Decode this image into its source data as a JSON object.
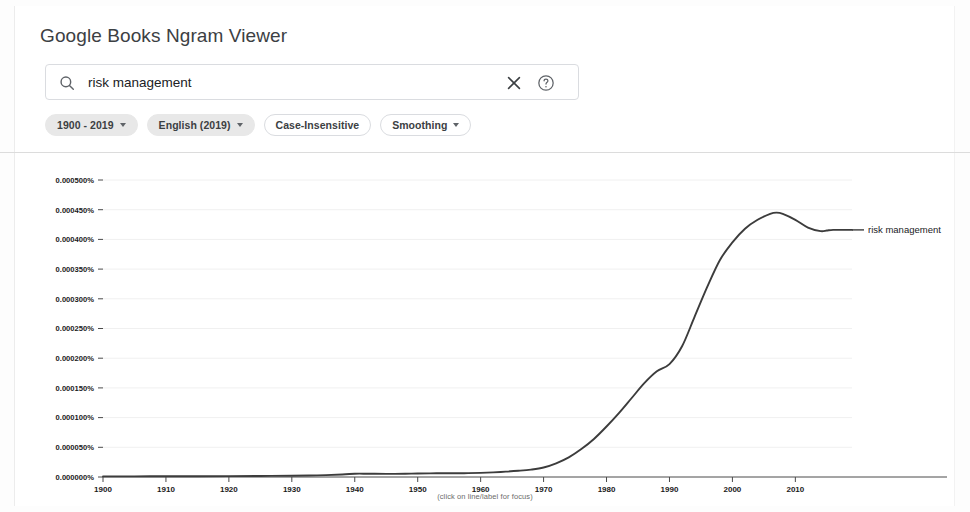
{
  "header": {
    "title": "Google Books Ngram Viewer"
  },
  "search": {
    "value": "risk management",
    "placeholder": "Search in Google Books Ngram Viewer",
    "search_icon": "search-icon",
    "clear_icon": "close-icon",
    "help_icon": "help-circle-icon"
  },
  "filters": [
    {
      "label": "1900 - 2019",
      "style": "filled",
      "has_caret": true
    },
    {
      "label": "English (2019)",
      "style": "filled",
      "has_caret": true
    },
    {
      "label": "Case-Insensitive",
      "style": "outlined",
      "has_caret": false
    },
    {
      "label": "Smoothing",
      "style": "outlined",
      "has_caret": true
    }
  ],
  "footer": {
    "note": "(click on line/label for focus)"
  },
  "colors": {
    "line": "#3c3c3c",
    "axis": "#555555",
    "grid": "#f0f0f0",
    "chip_fill": "#e8e8e8",
    "text": "#202124"
  },
  "chart_data": {
    "type": "line",
    "title": "",
    "xlabel": "",
    "ylabel": "",
    "xlim": [
      1900,
      2019
    ],
    "ylim": [
      0.0,
      0.0005
    ],
    "grid": true,
    "legend_position": "right-inline",
    "ytick_labels": [
      "0.000000%",
      "0.000050%",
      "0.000100%",
      "0.000150%",
      "0.000200%",
      "0.000250%",
      "0.000300%",
      "0.000350%",
      "0.000400%",
      "0.000450%",
      "0.000500%"
    ],
    "ytick_values": [
      0.0,
      5e-05,
      0.0001,
      0.00015,
      0.0002,
      0.00025,
      0.0003,
      0.00035,
      0.0004,
      0.00045,
      0.0005
    ],
    "xtick_labels": [
      "1900",
      "1910",
      "1920",
      "1930",
      "1940",
      "1950",
      "1960",
      "1970",
      "1980",
      "1990",
      "2000",
      "2010"
    ],
    "xtick_values": [
      1900,
      1910,
      1920,
      1930,
      1940,
      1950,
      1960,
      1970,
      1980,
      1990,
      2000,
      2010
    ],
    "series": [
      {
        "name": "risk management",
        "label": "risk management",
        "color": "#3c3c3c",
        "x": [
          1900,
          1905,
          1910,
          1915,
          1920,
          1925,
          1930,
          1934,
          1938,
          1940,
          1942,
          1945,
          1948,
          1950,
          1953,
          1956,
          1958,
          1960,
          1962,
          1964,
          1966,
          1968,
          1970,
          1972,
          1974,
          1976,
          1978,
          1980,
          1982,
          1984,
          1986,
          1988,
          1990,
          1992,
          1994,
          1996,
          1998,
          2000,
          2002,
          2004,
          2006,
          2007,
          2008,
          2010,
          2012,
          2014,
          2015,
          2016,
          2018,
          2019
        ],
        "y": [
          1e-06,
          1.1e-06,
          1.2e-06,
          1.3e-06,
          1.5e-06,
          1.8e-06,
          2.2e-06,
          2.8e-06,
          4.2e-06,
          5.5e-06,
          5.5e-06,
          5.2e-06,
          5.5e-06,
          6e-06,
          6.2e-06,
          6.3e-06,
          6.5e-06,
          7e-06,
          7.8e-06,
          9e-06,
          1.05e-05,
          1.25e-05,
          1.6e-05,
          2.3e-05,
          3.3e-05,
          4.7e-05,
          6.4e-05,
          8.5e-05,
          0.000108,
          0.000133,
          0.000158,
          0.000178,
          0.00019,
          0.00022,
          0.00027,
          0.00032,
          0.000365,
          0.000395,
          0.000418,
          0.000433,
          0.000443,
          0.000445,
          0.000443,
          0.000433,
          0.00042,
          0.000414,
          0.000415,
          0.000416,
          0.000416,
          0.000416
        ]
      }
    ]
  }
}
